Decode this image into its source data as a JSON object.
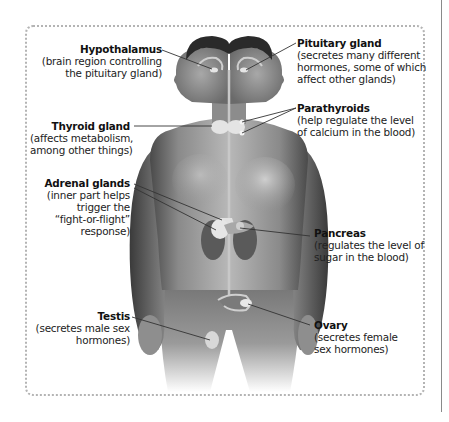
{
  "diagram": {
    "labels": [
      {
        "id": "hypothalamus",
        "title": "Hypothalamus",
        "desc": "(brain region controlling\nthe pituitary gland)"
      },
      {
        "id": "pituitary",
        "title": "Pituitary gland",
        "desc": "(secretes many different\nhormones, some of which\naffect other glands)"
      },
      {
        "id": "parathyroids",
        "title": "Parathyroids",
        "desc": "(help regulate the level\nof calcium in the blood)"
      },
      {
        "id": "thyroid",
        "title": "Thyroid gland",
        "desc": "(affects metabolism,\namong other things)"
      },
      {
        "id": "adrenal",
        "title": "Adrenal glands",
        "desc": "(inner part helps\ntrigger the\n“fight-or-flight”\nresponse)"
      },
      {
        "id": "pancreas",
        "title": "Pancreas",
        "desc": "(regulates the level of\nsugar in the blood)"
      },
      {
        "id": "testis",
        "title": "Testis",
        "desc": "(secretes male sex\nhormones)"
      },
      {
        "id": "ovary",
        "title": "Ovary",
        "desc": "(secretes female\nsex hormones)"
      }
    ],
    "colors": {
      "frame": "#b4b4b4",
      "leader": "#333333",
      "text": "#222222",
      "skin_dark": "#5a5a5a",
      "skin_light": "#d8d8d8"
    }
  }
}
